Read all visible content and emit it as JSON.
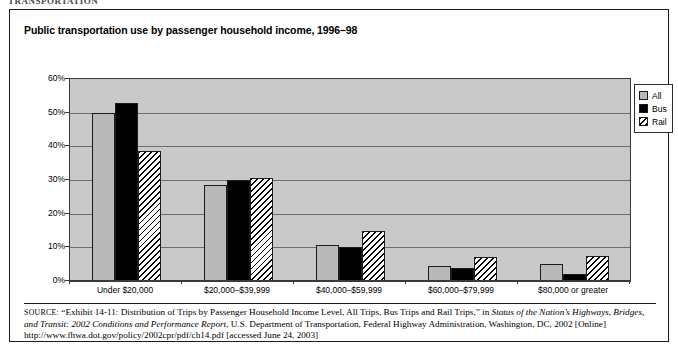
{
  "artifact": {
    "top_text": "TRANSPORTATION"
  },
  "figure": {
    "title": "Public transportation use by passenger household income, 1996–98"
  },
  "legend": {
    "position": "right",
    "items": [
      {
        "label": "All",
        "swatch": "gray-swatch-icon",
        "color": "#b8b8b8"
      },
      {
        "label": "Bus",
        "swatch": "black-swatch-icon",
        "color": "#000000"
      },
      {
        "label": "Rail",
        "swatch": "hatched-swatch-icon",
        "color": "#ffffff"
      }
    ]
  },
  "chart_data": {
    "type": "bar",
    "title": "Public transportation use by passenger household income, 1996–98",
    "xlabel": "",
    "ylabel": "",
    "ylim": [
      0,
      60
    ],
    "yticks": [
      0,
      10,
      20,
      30,
      40,
      50,
      60
    ],
    "ytick_labels": [
      "0%",
      "10%",
      "20%",
      "30%",
      "40%",
      "50%",
      "60%"
    ],
    "grid": true,
    "legend_position": "right",
    "categories": [
      "Under $20,000",
      "$20,000–$39,999",
      "$40,000–$59,999",
      "$60,000–$79,999",
      "$80,000 or greater"
    ],
    "series": [
      {
        "name": "All",
        "values": [
          50.0,
          28.5,
          10.8,
          4.5,
          5.0
        ]
      },
      {
        "name": "Bus",
        "values": [
          53.0,
          30.0,
          10.0,
          3.8,
          2.0
        ]
      },
      {
        "name": "Rail",
        "values": [
          38.5,
          30.5,
          15.0,
          7.0,
          7.5
        ]
      }
    ]
  },
  "source": {
    "label": "SOURCE:",
    "text_1": " “Exhibit 14-11: Distribution of Trips by Passenger Household Income Level, All Trips, Bus Trips and Rail Trips,” in ",
    "italic_1": "Status of the Nation’s Highways, Bridges, and Transit: 2002 Conditions and Performance Report",
    "text_2": ", U.S. Department of Transportation, Federal Highway Administration, Washington, DC, 2002 [Online] http://www.fhwa.dot.gov/policy/2002cpr/pdf/ch14.pdf [accessed June 24, 2003]"
  }
}
